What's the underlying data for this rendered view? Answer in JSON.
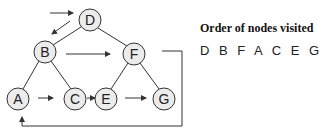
{
  "diagram": {
    "type": "binary-tree-traversal",
    "traversal": "breadth-first (level order)",
    "nodes": [
      {
        "id": "D",
        "label": "D",
        "x": 90,
        "y": 20
      },
      {
        "id": "B",
        "label": "B",
        "x": 45,
        "y": 52
      },
      {
        "id": "F",
        "label": "F",
        "x": 134,
        "y": 54
      },
      {
        "id": "A",
        "label": "A",
        "x": 18,
        "y": 99
      },
      {
        "id": "C",
        "label": "C",
        "x": 75,
        "y": 99
      },
      {
        "id": "E",
        "label": "E",
        "x": 106,
        "y": 99
      },
      {
        "id": "G",
        "label": "G",
        "x": 164,
        "y": 99
      }
    ],
    "edges": [
      {
        "from": "D",
        "to": "B"
      },
      {
        "from": "D",
        "to": "F"
      },
      {
        "from": "B",
        "to": "A"
      },
      {
        "from": "B",
        "to": "C"
      },
      {
        "from": "F",
        "to": "E"
      },
      {
        "from": "F",
        "to": "G"
      }
    ],
    "traversal_arrows": [
      {
        "from": "start",
        "to": "D"
      },
      {
        "from": "D",
        "to": "B"
      },
      {
        "from": "B",
        "to": "F"
      },
      {
        "from": "F",
        "to": "A"
      },
      {
        "from": "A",
        "to": "C"
      },
      {
        "from": "C",
        "to": "E"
      },
      {
        "from": "E",
        "to": "G"
      }
    ],
    "colors": {
      "node_fill": "#ececec",
      "stroke": "#333333",
      "text": "#222222"
    }
  },
  "legend": {
    "title": "Order of nodes visited",
    "order": "DBFACEG",
    "order_display": "D B F A C E G"
  }
}
